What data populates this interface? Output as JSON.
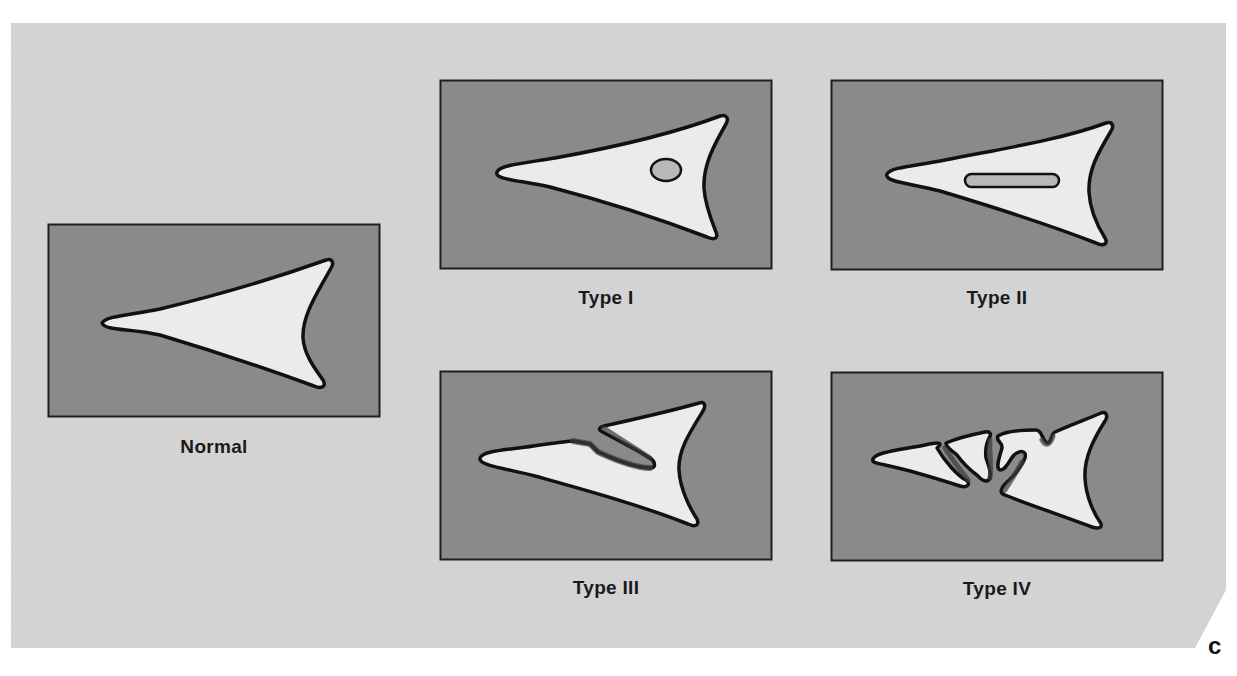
{
  "figure": {
    "panel_letter": "c",
    "colors": {
      "page_bg": "#ffffff",
      "panel_bg": "#d4d4d4",
      "box_bg": "#8a8a8a",
      "box_border": "#1e1e1e",
      "cell_fill": "#ebebeb",
      "cell_outline": "#111111",
      "nucleus_fill": "#b8b8b8"
    },
    "panels": [
      {
        "id": "normal",
        "label": "Normal",
        "box": {
          "x": 48,
          "y": 224,
          "w": 332,
          "h": 193
        },
        "label_center": {
          "x": 214,
          "y": 447
        }
      },
      {
        "id": "type-1",
        "label": "Type I",
        "box": {
          "x": 440,
          "y": 80,
          "w": 332,
          "h": 189
        },
        "label_center": {
          "x": 606,
          "y": 298
        },
        "feature": "round nucleus-like inclusion"
      },
      {
        "id": "type-2",
        "label": "Type II",
        "box": {
          "x": 831,
          "y": 80,
          "w": 332,
          "h": 190
        },
        "label_center": {
          "x": 997,
          "y": 298
        },
        "feature": "elongated inclusion"
      },
      {
        "id": "type-3",
        "label": "Type III",
        "box": {
          "x": 440,
          "y": 371,
          "w": 332,
          "h": 189
        },
        "label_center": {
          "x": 606,
          "y": 588
        },
        "feature": "single split/cleft"
      },
      {
        "id": "type-4",
        "label": "Type IV",
        "box": {
          "x": 831,
          "y": 372,
          "w": 332,
          "h": 189
        },
        "label_center": {
          "x": 997,
          "y": 589
        },
        "feature": "multiple fragments/clefts"
      }
    ]
  }
}
